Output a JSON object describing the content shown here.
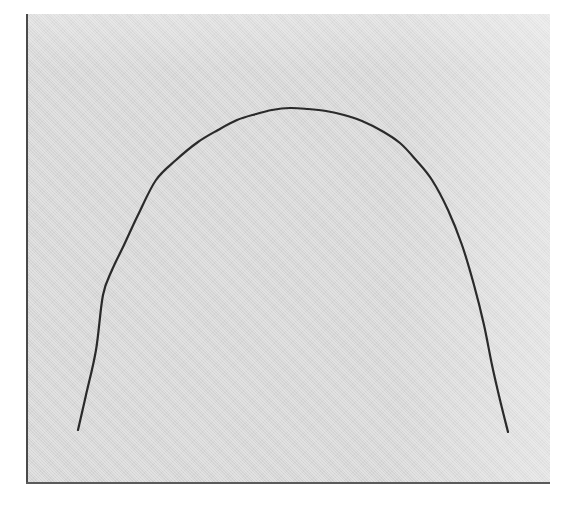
{
  "figure": {
    "title": "",
    "caption": "",
    "background_color": "#ffffff",
    "panel_color": "#d6d6d6",
    "frame_rule_color": "#4a4a4a",
    "curve_color": "#2a2a2a",
    "panel": {
      "left": 26,
      "top": 14,
      "width": 524,
      "height": 470
    },
    "frame_rules_visible": [
      "left",
      "bottom"
    ]
  },
  "chart_data": {
    "type": "line",
    "title": "",
    "subtitle": "",
    "xlabel": "",
    "ylabel": "",
    "grid": false,
    "legend": null,
    "legend_position": "none",
    "axis_ticks": {
      "x": [],
      "y": []
    },
    "xlim": [
      26,
      550
    ],
    "ylim": [
      14,
      484
    ],
    "y_axis_inverted": true,
    "annotations": [],
    "series": [
      {
        "name": "arch-curve",
        "color": "#2a2a2a",
        "stroke_width": 2.2,
        "description": "single smooth symmetric arch, flattened apex with near-vertical descending tails",
        "apex": {
          "x": 290,
          "y": 108
        },
        "endpoints": {
          "left": {
            "x": 78,
            "y": 430
          },
          "right": {
            "x": 508,
            "y": 432
          }
        },
        "x": [
          78,
          86,
          96,
          103,
          112,
          124,
          138,
          156,
          176,
          198,
          218,
          237,
          256,
          272,
          290,
          308,
          326,
          344,
          362,
          382,
          400,
          416,
          432,
          448,
          462,
          474,
          484,
          492,
          500,
          508
        ],
        "y": [
          430,
          395,
          350,
          295,
          270,
          245,
          215,
          180,
          160,
          142,
          130,
          120,
          114,
          110,
          108,
          109,
          111,
          115,
          121,
          131,
          143,
          160,
          180,
          210,
          245,
          285,
          325,
          365,
          400,
          432
        ]
      }
    ]
  }
}
